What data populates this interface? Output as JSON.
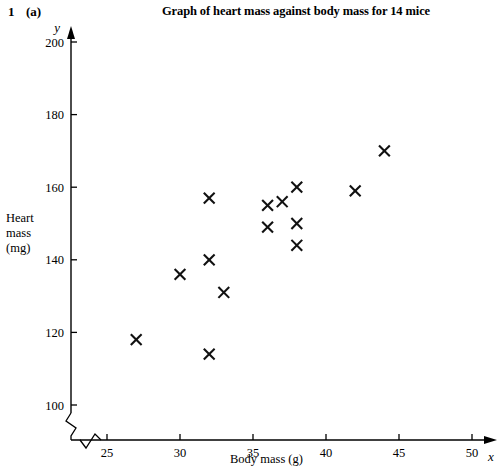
{
  "question": {
    "number": "1",
    "part": "(a)"
  },
  "header": {
    "title": "Graph of heart mass against body mass for 14 mice"
  },
  "axes": {
    "y_variable_symbol": "y",
    "x_variable_symbol": "x",
    "y_title_lines": [
      "Heart",
      "mass",
      "(mg)"
    ],
    "x_title": "Body mass (g)"
  },
  "chart_data": {
    "type": "scatter",
    "title": "Graph of heart mass against body mass for 14 mice",
    "xlabel": "Body mass (g)",
    "ylabel": "Heart mass (mg)",
    "xlim": [
      22.5,
      50
    ],
    "ylim": [
      96,
      203
    ],
    "xticks": [
      25,
      30,
      35,
      40,
      45,
      50
    ],
    "yticks": [
      100,
      120,
      140,
      160,
      180,
      200
    ],
    "grid": false,
    "legend": null,
    "axis_break_x": true,
    "axis_break_y": true,
    "marker": "x",
    "n_points": 14,
    "points": [
      {
        "x": 27,
        "y": 118
      },
      {
        "x": 30,
        "y": 136
      },
      {
        "x": 32,
        "y": 157
      },
      {
        "x": 32,
        "y": 140
      },
      {
        "x": 32,
        "y": 114
      },
      {
        "x": 33,
        "y": 131
      },
      {
        "x": 36,
        "y": 155
      },
      {
        "x": 36,
        "y": 149
      },
      {
        "x": 37,
        "y": 156
      },
      {
        "x": 38,
        "y": 160
      },
      {
        "x": 38,
        "y": 150
      },
      {
        "x": 38,
        "y": 144
      },
      {
        "x": 42,
        "y": 159
      },
      {
        "x": 44,
        "y": 170
      }
    ]
  }
}
